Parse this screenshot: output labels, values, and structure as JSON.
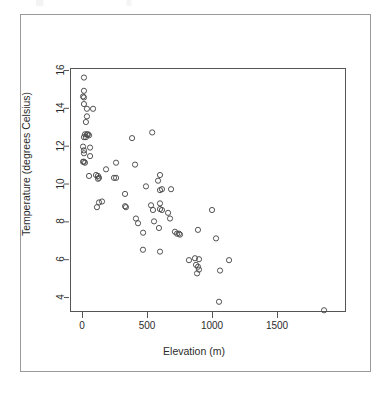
{
  "figure": {
    "background_color": "#ffffff",
    "frame_color": "#9a9a9a",
    "axis_color": "#555555",
    "point_color": "#4a4a4a"
  },
  "axis": {
    "x_title": "Elevation (m)",
    "y_title": "Temperature (degrees Celsius)",
    "x_ticks": [
      "0",
      "500",
      "1000",
      "1500"
    ],
    "y_ticks": [
      "4",
      "6",
      "8",
      "10",
      "12",
      "14",
      "16"
    ]
  },
  "chart_data": {
    "type": "scatter",
    "title": "",
    "subtitle": "",
    "xlabel": "Elevation (m)",
    "ylabel": "Temperature (degrees Celsius)",
    "xticks": [
      0,
      500,
      1000,
      1500
    ],
    "yticks": [
      4,
      6,
      8,
      10,
      12,
      14,
      16
    ],
    "xlim": [
      -90,
      1930
    ],
    "ylim": [
      2.9,
      16.3
    ],
    "grid": false,
    "legend": null,
    "marker": "open-circle",
    "marker_size_px": 4,
    "series": [
      {
        "name": "Stations",
        "points": [
          [
            15,
            15.6
          ],
          [
            15,
            14.9
          ],
          [
            8,
            14.6
          ],
          [
            15,
            14.55
          ],
          [
            15,
            14.2
          ],
          [
            38,
            13.95
          ],
          [
            85,
            13.95
          ],
          [
            38,
            13.55
          ],
          [
            30,
            13.25
          ],
          [
            23,
            12.6
          ],
          [
            38,
            12.6
          ],
          [
            46,
            12.6
          ],
          [
            54,
            12.55
          ],
          [
            15,
            12.45
          ],
          [
            30,
            12.45
          ],
          [
            8,
            11.95
          ],
          [
            62,
            11.9
          ],
          [
            15,
            11.75
          ],
          [
            15,
            11.6
          ],
          [
            62,
            11.45
          ],
          [
            8,
            11.15
          ],
          [
            15,
            11.15
          ],
          [
            23,
            11.1
          ],
          [
            385,
            12.4
          ],
          [
            540,
            12.7
          ],
          [
            262,
            11.1
          ],
          [
            408,
            11.0
          ],
          [
            54,
            10.4
          ],
          [
            108,
            10.45
          ],
          [
            123,
            10.4
          ],
          [
            131,
            10.3
          ],
          [
            185,
            10.75
          ],
          [
            246,
            10.3
          ],
          [
            262,
            10.3
          ],
          [
            123,
            10.25
          ],
          [
            492,
            9.85
          ],
          [
            585,
            10.15
          ],
          [
            600,
            10.45
          ],
          [
            615,
            9.7
          ],
          [
            685,
            9.7
          ],
          [
            331,
            9.45
          ],
          [
            600,
            9.65
          ],
          [
            115,
            8.75
          ],
          [
            131,
            9.0
          ],
          [
            154,
            9.05
          ],
          [
            331,
            8.8
          ],
          [
            338,
            8.75
          ],
          [
            531,
            8.85
          ],
          [
            546,
            8.6
          ],
          [
            600,
            8.95
          ],
          [
            600,
            8.65
          ],
          [
            615,
            8.6
          ],
          [
            662,
            8.45
          ],
          [
            1000,
            8.6
          ],
          [
            415,
            8.15
          ],
          [
            431,
            7.9
          ],
          [
            554,
            8.0
          ],
          [
            677,
            8.15
          ],
          [
            592,
            7.65
          ],
          [
            470,
            7.4
          ],
          [
            715,
            7.45
          ],
          [
            731,
            7.35
          ],
          [
            746,
            7.35
          ],
          [
            754,
            7.3
          ],
          [
            892,
            7.55
          ],
          [
            1031,
            7.1
          ],
          [
            469,
            6.5
          ],
          [
            600,
            6.4
          ],
          [
            823,
            5.95
          ],
          [
            869,
            6.05
          ],
          [
            900,
            6.0
          ],
          [
            877,
            5.7
          ],
          [
            892,
            5.6
          ],
          [
            900,
            5.45
          ],
          [
            885,
            5.25
          ],
          [
            1062,
            5.4
          ],
          [
            1131,
            5.95
          ],
          [
            1054,
            3.75
          ],
          [
            1862,
            3.3
          ]
        ]
      }
    ]
  }
}
